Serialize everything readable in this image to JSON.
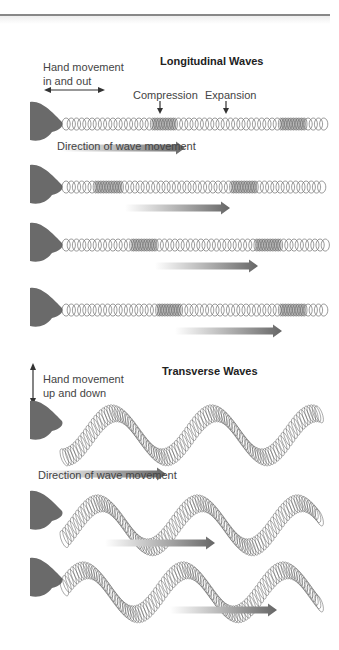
{
  "longitudinal": {
    "title": "Longitudinal Waves",
    "hand_label_line1": "Hand movement",
    "hand_label_line2": "in and out",
    "compression_label": "Compression",
    "expansion_label": "Expansion",
    "direction_label": "Direction of wave movement",
    "rows": [
      {
        "y": 124,
        "compressions": [
          160,
          290
        ],
        "arrow_x1": 60,
        "arrow_x2": 185
      },
      {
        "y": 187,
        "compressions": [
          105,
          240
        ],
        "arrow_x1": 125,
        "arrow_x2": 230
      },
      {
        "y": 245,
        "compressions": [
          140,
          265
        ],
        "arrow_x1": 155,
        "arrow_x2": 258
      },
      {
        "y": 310,
        "compressions": [
          165,
          290
        ],
        "arrow_x1": 175,
        "arrow_x2": 282
      }
    ]
  },
  "transverse": {
    "title": "Transverse Waves",
    "hand_label_line1": "Hand movement",
    "hand_label_line2": "up and down",
    "direction_label": "Direction of wave movement",
    "rows": [
      {
        "y": 418,
        "phase": 0,
        "arrow_x1": 40,
        "arrow_x2": 166
      },
      {
        "y": 508,
        "phase": 0.9,
        "arrow_x1": 105,
        "arrow_x2": 215
      },
      {
        "y": 575,
        "phase": 1.8,
        "arrow_x1": 170,
        "arrow_x2": 277
      }
    ]
  },
  "colors": {
    "coil": "#555555",
    "hand": "#6a6a6a",
    "arrow_dark": "#666666",
    "rule": "#888888"
  }
}
